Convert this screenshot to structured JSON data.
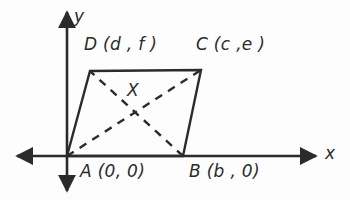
{
  "figure": {
    "kind": "coordinate-plane-parallelogram",
    "background_color": "#fdfdfd",
    "stroke_color": "#2b2b2b"
  },
  "axes": {
    "x_label": "x",
    "y_label": "y",
    "origin_px": [
      67,
      156
    ],
    "x_axis_span_px": [
      17,
      316
    ],
    "y_axis_span_px": [
      12,
      191
    ],
    "arrowheads": [
      "left",
      "right",
      "up",
      "down"
    ]
  },
  "labels": {
    "vertex_A": "A (0, 0)",
    "vertex_B": "B (b , 0)",
    "vertex_C": "C (c ,e )",
    "vertex_D": "D (d , f )",
    "intersection": "X"
  },
  "vertices": [
    {
      "name": "A",
      "label": "A (0, 0)",
      "coords": "(0, 0)",
      "px": [
        67,
        156
      ]
    },
    {
      "name": "B",
      "label": "B (b , 0)",
      "coords": "(b, 0)",
      "px": [
        183,
        156
      ]
    },
    {
      "name": "C",
      "label": "C (c ,e )",
      "coords": "(c, e)",
      "px": [
        201,
        70
      ]
    },
    {
      "name": "D",
      "label": "D (d , f )",
      "coords": "(d, f)",
      "px": [
        90,
        71
      ]
    }
  ],
  "edges": [
    {
      "name": "AB",
      "style": "solid",
      "from": "A",
      "to": "B"
    },
    {
      "name": "BC",
      "style": "solid",
      "from": "B",
      "to": "C"
    },
    {
      "name": "CD",
      "style": "solid",
      "from": "C",
      "to": "D"
    },
    {
      "name": "DA",
      "style": "solid",
      "from": "D",
      "to": "A"
    }
  ],
  "diagonals": [
    {
      "name": "AC",
      "style": "dashed",
      "from": "A",
      "to": "C"
    },
    {
      "name": "BD",
      "style": "dashed",
      "from": "B",
      "to": "D"
    }
  ]
}
